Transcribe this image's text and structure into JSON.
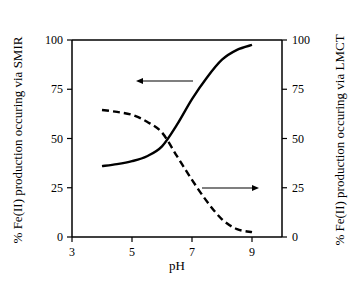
{
  "chart_data": {
    "type": "line",
    "title": "",
    "xlabel": "pH",
    "ylabel_left": "% Fe(II) production occuring via SMIR",
    "ylabel_right": "% Fe(II) production occuring via LMCT",
    "xlim": [
      3,
      10
    ],
    "ylim_left": [
      0,
      100
    ],
    "ylim_right": [
      0,
      100
    ],
    "x_ticks": [
      3,
      5,
      7,
      9
    ],
    "y_ticks_left": [
      0,
      25,
      50,
      75,
      100
    ],
    "y_ticks_right": [
      0,
      25,
      50,
      75,
      100
    ],
    "grid": false,
    "legend": "none (arrows indicate axis for each curve)",
    "x": [
      4,
      4.5,
      5,
      5.5,
      6,
      6.5,
      7,
      7.5,
      8,
      8.5,
      9
    ],
    "series": [
      {
        "name": "SMIR",
        "axis": "left",
        "style": "solid",
        "values": [
          36,
          37,
          38.5,
          41,
          46,
          57,
          70,
          81,
          90,
          95,
          97.5
        ]
      },
      {
        "name": "LMCT",
        "axis": "right",
        "style": "dashed",
        "values": [
          64.5,
          63.5,
          62,
          58.5,
          53,
          41,
          29,
          18,
          9,
          4,
          2.5
        ]
      }
    ],
    "annotations": [
      {
        "type": "arrow",
        "direction": "left",
        "points_to": "left axis (SMIR, solid curve)"
      },
      {
        "type": "arrow",
        "direction": "right",
        "points_to": "right axis (LMCT, dashed curve)"
      }
    ]
  }
}
